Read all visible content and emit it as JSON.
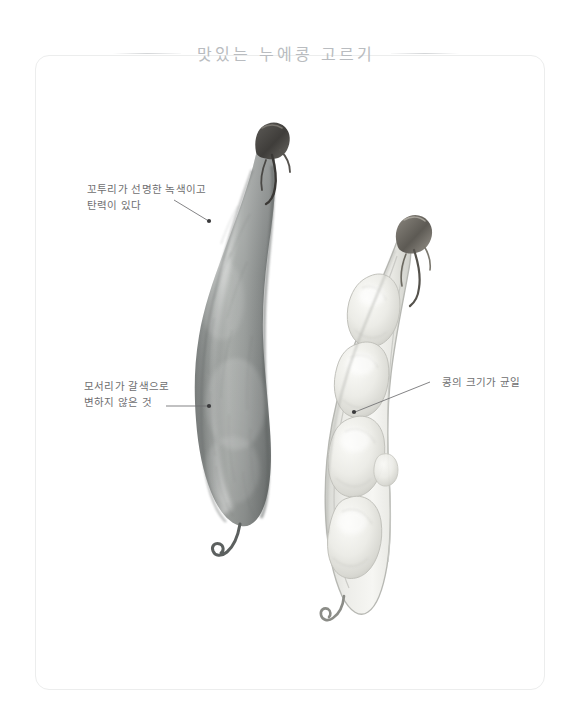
{
  "page": {
    "title": "맛있는 누에콩 고르기",
    "background_color": "#ffffff",
    "frame_color": "#eceded",
    "title_color": "#b9bcc0",
    "text_color": "#6e6e70"
  },
  "annotations": [
    {
      "id": "pod-color",
      "text": "꼬투리가 선명한 녹색이고\n탄력이 있다",
      "target": "left-pod-upper-surface"
    },
    {
      "id": "edge",
      "text": "모서리가 갈색으로\n변하지 않은 것",
      "target": "left-pod-edge"
    },
    {
      "id": "bean-size",
      "text": "콩의 크기가 균일",
      "target": "right-pod-bean"
    }
  ],
  "illustration": {
    "left_pod": {
      "label": "green fava bean pod, closed, whole",
      "fill_color": "#8e9190",
      "shadow_color": "#6f7372",
      "highlight_color": "#b9bdbb",
      "stem_color": "#4a4846"
    },
    "right_pod": {
      "label": "fava bean pod, opened cross-section showing four beans",
      "fill_color": "#efefec",
      "outline_color": "#b6b7b3",
      "bean_color": "#e6e6e1",
      "bean_shade_color": "#cfcfc9",
      "stem_color": "#6a6762",
      "bean_count": 4
    }
  }
}
